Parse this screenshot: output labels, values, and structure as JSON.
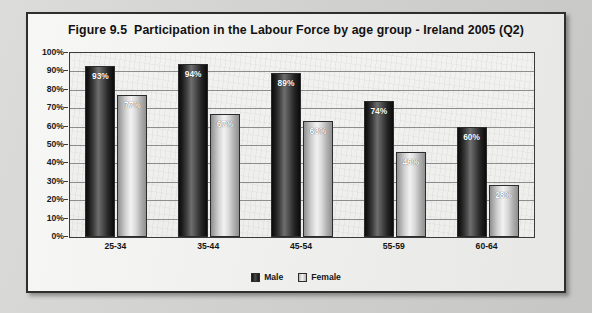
{
  "chart_data": {
    "type": "bar",
    "title_figure_number": "Figure 9.5",
    "title_text": "Participation in the Labour Force by age group - Ireland 2005 (Q2)",
    "categories": [
      "25-34",
      "35-44",
      "45-54",
      "55-59",
      "60-64"
    ],
    "series": [
      {
        "name": "Male",
        "values": [
          93,
          94,
          89,
          74,
          60
        ],
        "color": "#141414"
      },
      {
        "name": "Female",
        "values": [
          77,
          67,
          63,
          46,
          28
        ],
        "color": "#d0d0d0"
      }
    ],
    "data_labels": {
      "Male": [
        "93%",
        "94%",
        "89%",
        "74%",
        "60%"
      ],
      "Female": [
        "77%",
        "67%",
        "63%",
        "46%",
        "28%"
      ]
    },
    "xlabel": "",
    "ylabel": "",
    "ylim": [
      0,
      100
    ],
    "ytick_values": [
      100,
      90,
      80,
      70,
      60,
      50,
      40,
      30,
      20,
      10,
      0
    ],
    "ytick_labels": [
      "100%",
      "90%",
      "80%",
      "70%",
      "60%",
      "50%",
      "40%",
      "30%",
      "20%",
      "10%",
      "0%"
    ],
    "grid": true,
    "legend_position": "bottom",
    "legend_entries": [
      "Male",
      "Female"
    ]
  }
}
